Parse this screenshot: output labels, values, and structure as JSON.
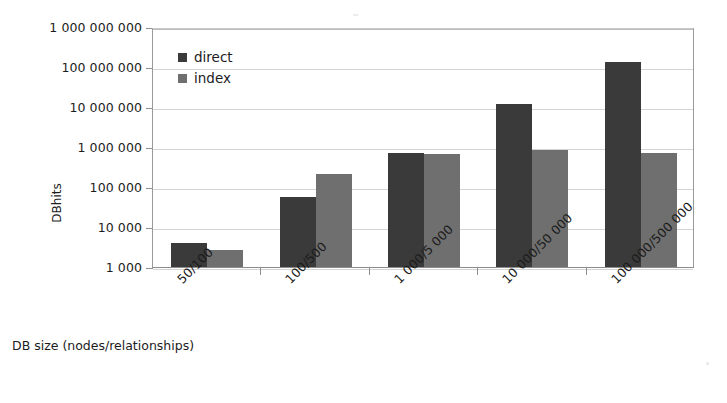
{
  "chart_data": {
    "type": "bar",
    "title": "",
    "xlabel": "DB size (nodes/relationships)",
    "ylabel": "DBhits",
    "yscale": "log",
    "ylim": [
      1000,
      1000000000
    ],
    "grid": true,
    "legend_position": "top-left-inside",
    "categories": [
      "50/100",
      "100/500",
      "1 000/5 000",
      "10 000/50 000",
      "100 000/500 000"
    ],
    "ytick_labels": [
      "1 000 000 000",
      "100 000 000",
      "10 000 000",
      "1 000 000",
      "100 000",
      "10 000",
      "1 000"
    ],
    "ytick_values": [
      1000000000,
      100000000,
      10000000,
      1000000,
      100000,
      10000,
      1000
    ],
    "series": [
      {
        "name": "direct",
        "color": "#3a3a3a",
        "values": [
          4000,
          55000,
          700000,
          12000000,
          130000000
        ]
      },
      {
        "name": "index",
        "color": "#6f6f6f",
        "values": [
          2600,
          210000,
          650000,
          850000,
          700000
        ]
      }
    ]
  },
  "legend": {
    "items": [
      {
        "label": "direct"
      },
      {
        "label": "index"
      }
    ]
  },
  "icons": {
    "legend_swatch_direct": "square-swatch-icon",
    "legend_swatch_index": "square-swatch-icon"
  }
}
